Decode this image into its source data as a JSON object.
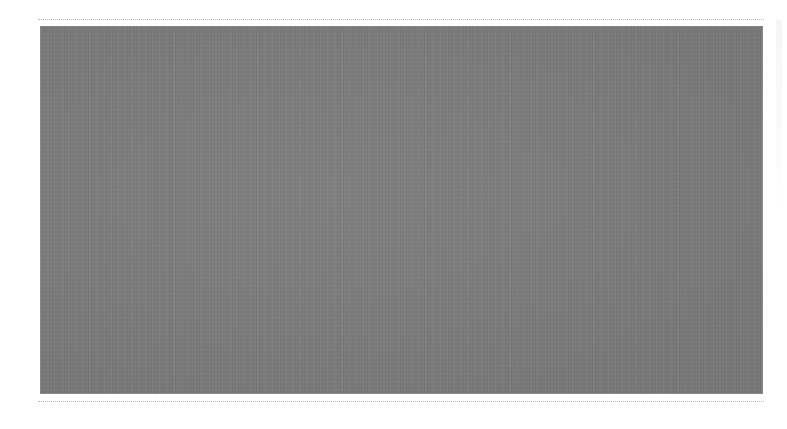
{
  "page": {
    "background_color": "#ffffff",
    "rule_color": "#b9b9b9"
  },
  "media_block": {
    "fill_color": "#7b7b7b",
    "alt_text": ""
  }
}
